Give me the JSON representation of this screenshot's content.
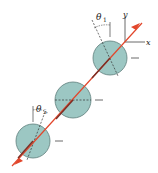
{
  "diagram": {
    "axes": {
      "x_label": "x",
      "y_label": "y"
    },
    "angle_top": {
      "symbol": "θ",
      "subscript": "1"
    },
    "angle_bottom": {
      "symbol": "θ",
      "subscript": "5"
    },
    "colors": {
      "sphere_fill": "#9cc7c3",
      "sphere_stroke": "#5f7f7c",
      "line": "#e2462b",
      "ink": "#333333"
    },
    "spheres": [
      {
        "name": "top"
      },
      {
        "name": "middle"
      },
      {
        "name": "bottom"
      }
    ]
  }
}
